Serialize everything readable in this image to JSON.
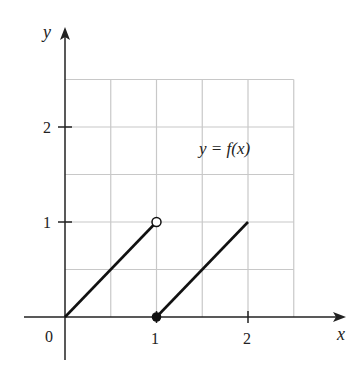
{
  "chart_data": {
    "type": "line",
    "title": "",
    "annotation": "y = f(x)",
    "xlabel": "x",
    "ylabel": "y",
    "xlim": [
      -0.35,
      2.95
    ],
    "ylim": [
      -0.55,
      3.1
    ],
    "grid": true,
    "grid_step": 0.5,
    "grid_extent": {
      "x": [
        0,
        2.5
      ],
      "y": [
        0,
        2.5
      ]
    },
    "x_ticks": [
      {
        "value": 0,
        "label": "0"
      },
      {
        "value": 1,
        "label": "1"
      },
      {
        "value": 2,
        "label": "2"
      }
    ],
    "y_ticks": [
      {
        "value": 1,
        "label": "1"
      },
      {
        "value": 2,
        "label": "2"
      }
    ],
    "series": [
      {
        "name": "segment-1",
        "points": [
          [
            0,
            0
          ],
          [
            1,
            1
          ]
        ],
        "start_marker": "none",
        "end_marker": "open-circle"
      },
      {
        "name": "segment-2",
        "points": [
          [
            1,
            0
          ],
          [
            2,
            1
          ]
        ],
        "start_marker": "filled-circle",
        "end_marker": "none"
      }
    ],
    "colors": {
      "line": "#111111",
      "grid": "#c8c8c8",
      "axis": "#222222"
    }
  },
  "labels": {
    "x_axis": "x",
    "y_axis": "y",
    "function": "y = f(x)",
    "origin": "0",
    "x_tick_1": "1",
    "x_tick_2": "2",
    "y_tick_1": "1",
    "y_tick_2": "2"
  }
}
